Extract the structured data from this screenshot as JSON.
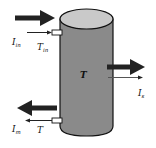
{
  "diagram": {
    "colors": {
      "background": "#ffffff",
      "tank_body": "#8a8a8a",
      "tank_top": "#c9c9c9",
      "stroke": "#111111",
      "arrow": "#222222",
      "port": "#ffffff"
    },
    "tank": {
      "label": "T",
      "left_x": 60,
      "right_x": 113,
      "top_cy": 19,
      "top_ry": 10,
      "bottom_y": 128
    },
    "ports": [
      {
        "name": "inlet-port",
        "x": 52,
        "y": 30,
        "w": 10,
        "h": 5
      },
      {
        "name": "outlet-port",
        "x": 52,
        "y": 118,
        "w": 10,
        "h": 5
      }
    ],
    "labels": {
      "inlet_flow": {
        "main": "I",
        "sub": "in"
      },
      "inlet_temp": {
        "main": "T",
        "sub": "in"
      },
      "tank_temp": "T",
      "side_flow": {
        "main": "I",
        "sub": "s"
      },
      "outlet_flow": {
        "main": "I",
        "sub": "m"
      },
      "outlet_temp": "T"
    },
    "arrows": [
      {
        "name": "inlet-heat-arrow",
        "kind": "thick",
        "direction": "right"
      },
      {
        "name": "inlet-flow-arrow",
        "kind": "thin",
        "direction": "right"
      },
      {
        "name": "side-heat-arrow",
        "kind": "thick",
        "direction": "right"
      },
      {
        "name": "side-flow-arrow",
        "kind": "thin",
        "direction": "right"
      },
      {
        "name": "outlet-heat-arrow",
        "kind": "thick",
        "direction": "left"
      },
      {
        "name": "outlet-flow-arrow",
        "kind": "thin",
        "direction": "left"
      }
    ]
  }
}
